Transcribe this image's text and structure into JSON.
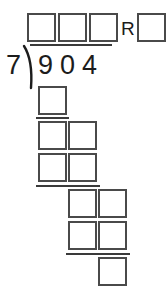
{
  "worksheet": {
    "type": "long-division",
    "problem": {
      "divisor": "7",
      "dividend": "904",
      "dividend_digits": [
        "9",
        "0",
        "4"
      ],
      "remainder_label": "R"
    },
    "quotient_boxes": [
      {
        "name": "quotient-digit-1",
        "value": "",
        "x": 27,
        "y": 13
      },
      {
        "name": "quotient-digit-2",
        "value": "",
        "x": 58,
        "y": 13
      },
      {
        "name": "quotient-digit-3",
        "value": "",
        "x": 89,
        "y": 13
      }
    ],
    "remainder_box": {
      "name": "remainder-digit",
      "value": "",
      "x": 137,
      "y": 13
    },
    "remainder_marker": {
      "text": "R",
      "x": 121,
      "y": 19
    },
    "vinculum": {
      "x": 30,
      "y": 44,
      "width": 82
    },
    "divisor_text": {
      "text": "7",
      "x": 6,
      "y": 52
    },
    "dividend_text": [
      {
        "text": "9",
        "x": 38,
        "y": 52
      },
      {
        "text": "0",
        "x": 60,
        "y": 52
      },
      {
        "text": "4",
        "x": 82,
        "y": 52
      }
    ],
    "work_rows": [
      {
        "name": "step-1-product",
        "boxes": [
          {
            "value": "",
            "x": 38,
            "y": 86
          }
        ],
        "rule": {
          "x": 36,
          "y": 117,
          "width": 33
        }
      },
      {
        "name": "step-1-difference",
        "boxes": [
          {
            "value": "",
            "x": 38,
            "y": 121
          },
          {
            "value": "",
            "x": 68,
            "y": 121
          }
        ],
        "rule": null
      },
      {
        "name": "step-2-product",
        "boxes": [
          {
            "value": "",
            "x": 38,
            "y": 153
          },
          {
            "value": "",
            "x": 68,
            "y": 153
          }
        ],
        "rule": {
          "x": 36,
          "y": 185,
          "width": 64
        }
      },
      {
        "name": "step-2-difference",
        "boxes": [
          {
            "value": "",
            "x": 68,
            "y": 189
          },
          {
            "value": "",
            "x": 98,
            "y": 189
          }
        ],
        "rule": null
      },
      {
        "name": "step-3-product",
        "boxes": [
          {
            "value": "",
            "x": 68,
            "y": 221
          },
          {
            "value": "",
            "x": 98,
            "y": 221
          }
        ],
        "rule": {
          "x": 66,
          "y": 253,
          "width": 64
        }
      },
      {
        "name": "final-remainder",
        "boxes": [
          {
            "value": "",
            "x": 98,
            "y": 257
          }
        ],
        "rule": null
      }
    ],
    "colors": {
      "box_border": "#4a4a4a",
      "rule": "#3a3a3a",
      "text": "#1c1c1c",
      "background": "#ffffff"
    }
  }
}
